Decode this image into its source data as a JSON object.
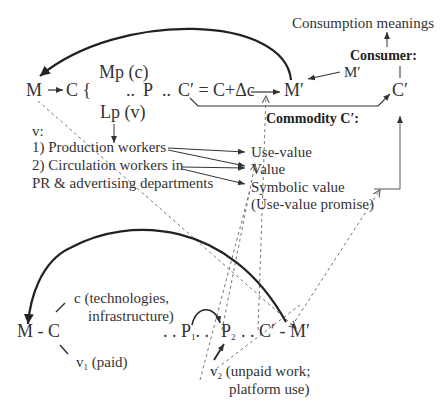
{
  "top_circuit": {
    "m": "M",
    "arrow_c": "C {",
    "mp": "Mp (c)",
    "dots1": "..",
    "p": "P",
    "dots2": "..",
    "c_prime_eq": "C′ = C+Δc",
    "m_prime": "M′",
    "lp": "Lp (v)",
    "v_label": "v:",
    "workers": [
      "1) Production workers",
      "2) Circulation workers in",
      "PR & advertising departments"
    ],
    "commodity_label": "Commodity C′:",
    "values": [
      "Use-value",
      "Value",
      "Symbolic value",
      "(Use-value promise)"
    ],
    "consumption_meanings": "Consumption meanings",
    "consumer_label": "Consumer:",
    "consumer_m_prime": "M′",
    "consumer_c_prime": "C′"
  },
  "bottom_circuit": {
    "m_c": "M - C",
    "c_tech": "c (technologies,",
    "c_infra": "infrastructure)",
    "v1": "v",
    "v1_sub": "1",
    "v1_paid": "(paid)",
    "p1_prefix": ". . P",
    "p1_sub": "1",
    "p1_suffix": ". .",
    "p2": "P",
    "p2_sub": "2",
    "c_m_prime": ". . C′ - M′",
    "v2": "v",
    "v2_sub": "2",
    "v2_unpaid": "(unpaid work;",
    "v2_platform": "platform use)"
  }
}
